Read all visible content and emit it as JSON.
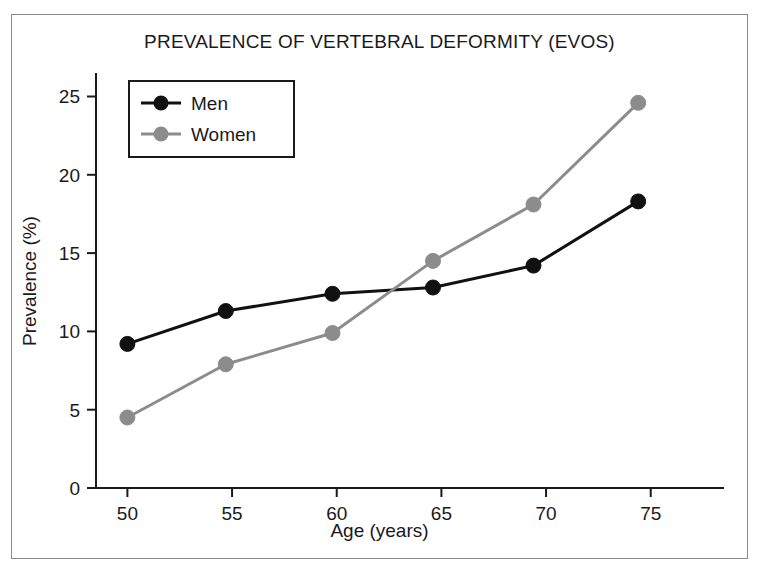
{
  "figure": {
    "border_color": "#8a8a8a",
    "background": "#ffffff"
  },
  "chart_data": {
    "type": "line",
    "title": "PREVALENCE OF VERTEBRAL DEFORMITY (EVOS)",
    "xlabel": "Age (years)",
    "ylabel": "Prevalence (%)",
    "x": [
      50,
      54.7,
      59.8,
      64.6,
      69.4,
      74.4
    ],
    "xticks": [
      50,
      55,
      60,
      65,
      70,
      75
    ],
    "xticklabels": [
      "50",
      "55",
      "60",
      "65",
      "70",
      "75"
    ],
    "yticks": [
      0,
      5,
      10,
      15,
      20,
      25
    ],
    "yticklabels": [
      "0",
      "5",
      "10",
      "15",
      "20",
      "25"
    ],
    "xlim": [
      48.5,
      78.5
    ],
    "ylim": [
      0,
      26.5
    ],
    "grid": false,
    "legend_position": "upper left",
    "series": [
      {
        "name": "Men",
        "color": "#111111",
        "marker": "circle",
        "values": [
          9.2,
          11.3,
          12.4,
          12.8,
          14.2,
          18.3
        ]
      },
      {
        "name": "Women",
        "color": "#8c8c8c",
        "marker": "circle",
        "values": [
          4.5,
          7.9,
          9.9,
          14.5,
          18.1,
          24.6
        ]
      }
    ]
  },
  "legend": {
    "items": [
      {
        "label": "Men",
        "color": "#111111"
      },
      {
        "label": "Women",
        "color": "#8c8c8c"
      }
    ]
  },
  "axis": {
    "line_color": "#1a1a1a"
  }
}
